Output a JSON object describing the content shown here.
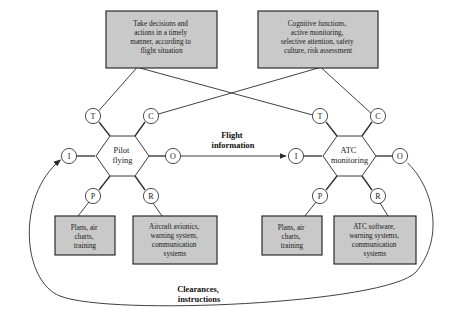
{
  "diagram": {
    "colors": {
      "box_fill": "#c9c9c9",
      "box_stroke": "#1a1a1a",
      "hex_fill": "#ffffff",
      "line": "#2b2b2b",
      "background": "#ffffff"
    },
    "boxes": {
      "pilot_control": {
        "lines": [
          "Take decisions and",
          "actions in a timely",
          "manner, according to",
          "flight situation"
        ]
      },
      "atc_control": {
        "lines": [
          "Cognitive functions,",
          "active monitoring,",
          "selective attention, safety",
          "culture, risk assessment"
        ]
      },
      "pilot_precondition": {
        "lines": [
          "Plans, air",
          "charts,",
          "training"
        ]
      },
      "pilot_resource": {
        "lines": [
          "Aircraft avionics,",
          "warning system,",
          "communication",
          "systems"
        ]
      },
      "atc_precondition": {
        "lines": [
          "Plans, air",
          "charts,",
          "training"
        ]
      },
      "atc_resource": {
        "lines": [
          "ATC software,",
          "warning systems,",
          "communication",
          "systems"
        ]
      }
    },
    "hexagons": {
      "pilot": {
        "lines": [
          "Pilot",
          "flying"
        ]
      },
      "atc": {
        "lines": [
          "ATC",
          "monitoring"
        ]
      }
    },
    "nodes": {
      "pilot": {
        "time": "T",
        "control": "C",
        "input": "I",
        "output": "O",
        "precondition": "P",
        "resource": "R"
      },
      "atc": {
        "time": "T",
        "control": "C",
        "input": "I",
        "output": "O",
        "precondition": "P",
        "resource": "R"
      }
    },
    "edge_labels": {
      "flight_information": [
        "Flight",
        "information"
      ],
      "clearances": [
        "Clearances,",
        "instructions"
      ]
    }
  }
}
